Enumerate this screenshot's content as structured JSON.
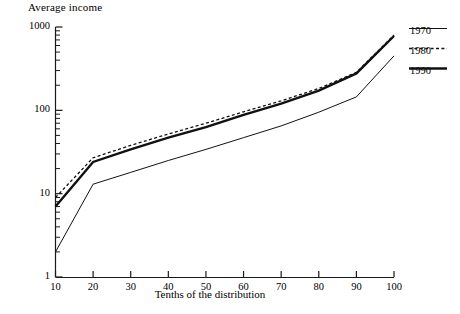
{
  "chart_data": {
    "type": "line",
    "title": "Average income",
    "xlabel": "Tenths of the distribution",
    "ylabel": "",
    "x": [
      10,
      20,
      30,
      40,
      50,
      60,
      70,
      80,
      90,
      100
    ],
    "categories": [
      "10",
      "20",
      "30",
      "40",
      "50",
      "60",
      "70",
      "80",
      "90",
      "100"
    ],
    "xlim": [
      10,
      100
    ],
    "ylim": [
      1,
      1000
    ],
    "yscale": "log",
    "grid": false,
    "legend_position": "top-right",
    "series": [
      {
        "name": "1970",
        "style": "solid-thin",
        "values": [
          2.0,
          13.0,
          18.0,
          25.0,
          34.0,
          47.0,
          65.0,
          95.0,
          145.0,
          450.0
        ]
      },
      {
        "name": "1980",
        "style": "dashed",
        "values": [
          9.0,
          27.0,
          38.0,
          52.0,
          70.0,
          96.0,
          130.0,
          183.0,
          285.0,
          800.0
        ]
      },
      {
        "name": "1990",
        "style": "solid-thick",
        "values": [
          7.0,
          24.0,
          34.0,
          47.0,
          63.0,
          88.0,
          120.0,
          172.0,
          277.0,
          780.0
        ]
      }
    ],
    "y_tick_labels": [
      "1000",
      "100",
      "10",
      "1"
    ],
    "y_tick_values": [
      1000,
      100,
      10,
      1
    ]
  },
  "legend": {
    "entries": [
      {
        "label": "1970"
      },
      {
        "label": "1980"
      },
      {
        "label": "1990"
      }
    ]
  }
}
